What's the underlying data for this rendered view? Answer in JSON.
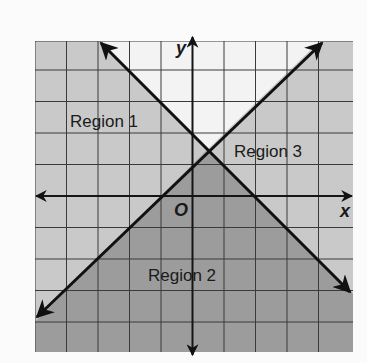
{
  "diagram": {
    "type": "coordinate-plane-inequalities",
    "axes": {
      "x_label": "x",
      "y_label": "y",
      "origin_label": "O"
    },
    "grid": {
      "x_min": -5,
      "x_max": 5,
      "y_min": -5,
      "y_max": 5
    },
    "lines": [
      {
        "name": "line-1",
        "equation": "y = x + 1",
        "slope": 1,
        "intercept": 1
      },
      {
        "name": "line-2",
        "equation": "y = -x + 2",
        "slope": -1,
        "intercept": 2
      }
    ],
    "intersection": {
      "x": 0.5,
      "y": 1.5
    },
    "regions": [
      {
        "label": "Region 1",
        "shade": "light"
      },
      {
        "label": "Region 2",
        "shade": "dark"
      },
      {
        "label": "Region 3",
        "shade": "light"
      }
    ],
    "colors": {
      "dark_region": "#9c9c9c",
      "light_region": "#c9c9c9",
      "unshaded": "#f3f3f3",
      "grid_line": "#3a3a3a",
      "axis_line": "#151515",
      "boundary_line": "#111111"
    }
  }
}
